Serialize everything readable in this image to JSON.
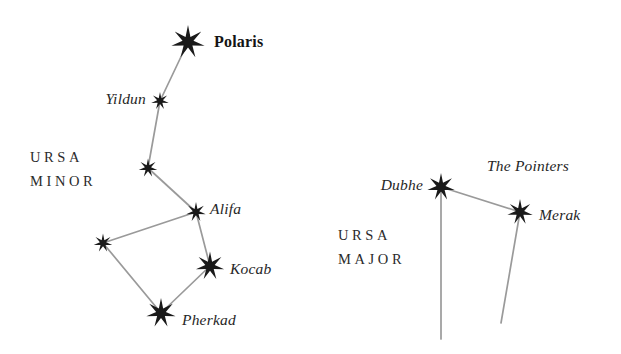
{
  "figure": {
    "background_color": "#ffffff",
    "line_color": "#9a9a9a",
    "star_color": "#1a1a1a",
    "width": 621,
    "height": 354
  },
  "chart_data": {
    "type": "scatter",
    "xlabel": "",
    "ylabel": "",
    "xlim": [
      0,
      621
    ],
    "ylim": [
      354,
      0
    ],
    "grid": false,
    "legend": "none",
    "constellations": [
      {
        "id": "ursa-minor",
        "label_lines": [
          "URSA",
          "MINOR"
        ],
        "label_x": 30,
        "label_y": 150,
        "stars": [
          {
            "id": "polaris",
            "name": "Polaris",
            "x": 188,
            "y": 42,
            "size": 34,
            "label_side": "right",
            "label_dx": 26,
            "label_dy": 0,
            "label_style": "bold"
          },
          {
            "id": "yildun",
            "name": "Yildun",
            "x": 160,
            "y": 101,
            "size": 18,
            "label_side": "left",
            "label_dx": -14,
            "label_dy": -2,
            "label_style": "italic"
          },
          {
            "id": "epsilon-umi",
            "name": "",
            "x": 148,
            "y": 168,
            "size": 19,
            "label_side": "none",
            "label_dx": 0,
            "label_dy": 0,
            "label_style": "italic"
          },
          {
            "id": "alifa",
            "name": "Alifa",
            "x": 196,
            "y": 212,
            "size": 20,
            "label_side": "right",
            "label_dx": 14,
            "label_dy": -3,
            "label_style": "italic"
          },
          {
            "id": "zeta-umi",
            "name": "",
            "x": 103,
            "y": 243,
            "size": 19,
            "label_side": "none",
            "label_dx": 0,
            "label_dy": 0,
            "label_style": "italic"
          },
          {
            "id": "kocab",
            "name": "Kocab",
            "x": 210,
            "y": 266,
            "size": 29,
            "label_side": "right",
            "label_dx": 20,
            "label_dy": 3,
            "label_style": "italic"
          },
          {
            "id": "pherkad",
            "name": "Pherkad",
            "x": 161,
            "y": 313,
            "size": 30,
            "label_side": "right",
            "label_dx": 21,
            "label_dy": 7,
            "label_style": "italic"
          }
        ],
        "lines": [
          {
            "from": "polaris",
            "to": "yildun"
          },
          {
            "from": "yildun",
            "to": "epsilon-umi"
          },
          {
            "from": "epsilon-umi",
            "to": "alifa"
          },
          {
            "from": "alifa",
            "to": "zeta-umi"
          },
          {
            "from": "alifa",
            "to": "kocab"
          },
          {
            "from": "zeta-umi",
            "to": "pherkad"
          },
          {
            "from": "kocab",
            "to": "pherkad"
          }
        ]
      },
      {
        "id": "ursa-major",
        "label_lines": [
          "URSA",
          "MAJOR"
        ],
        "label_x": 338,
        "label_y": 228,
        "stars": [
          {
            "id": "dubhe",
            "name": "Dubhe",
            "x": 441,
            "y": 187,
            "size": 28,
            "label_side": "left",
            "label_dx": -18,
            "label_dy": -2,
            "label_style": "italic"
          },
          {
            "id": "merak",
            "name": "Merak",
            "x": 520,
            "y": 212,
            "size": 26,
            "label_side": "right",
            "label_dx": 19,
            "label_dy": 3,
            "label_style": "italic"
          }
        ],
        "lines": [
          {
            "from": "dubhe",
            "to": "merak"
          }
        ],
        "open_lines": [
          {
            "from": "dubhe",
            "to_x": 441,
            "to_y": 339
          },
          {
            "from": "merak",
            "to_x": 501,
            "to_y": 323
          }
        ],
        "annotations": [
          {
            "id": "the-pointers",
            "text": "The Pointers",
            "x": 487,
            "y": 166,
            "style": "italic"
          }
        ]
      }
    ]
  }
}
